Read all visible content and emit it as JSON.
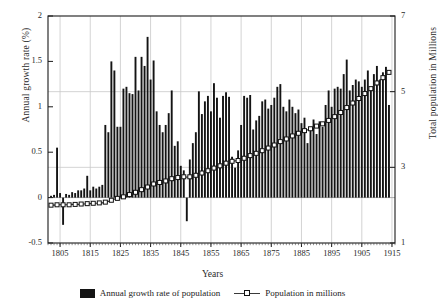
{
  "chart_data": {
    "type": "bar",
    "title": "",
    "xlabel": "Years",
    "ylabel": "Annual growth rate (%)",
    "ylabel_right": "Total population in Millions",
    "grid": true,
    "legend_position": "bottom-center",
    "xlim": [
      1801,
      1916
    ],
    "ylim": [
      -0.5,
      2
    ],
    "ylim_right": [
      1,
      7
    ],
    "xticks": [
      1805,
      1815,
      1825,
      1835,
      1845,
      1855,
      1865,
      1875,
      1885,
      1895,
      1905,
      1915
    ],
    "xtick_labels": [
      "1805",
      "1815",
      "1825",
      "1835",
      "1845",
      "1855",
      "1865",
      "1875",
      "1885",
      "1895",
      "1905",
      "1915"
    ],
    "yticks_left": [
      -0.5,
      0,
      0.5,
      1,
      1.5,
      2
    ],
    "ytick_labels_left": [
      "-0.5",
      "0",
      "0.5",
      "1",
      "1.5",
      "2"
    ],
    "yticks_right": [
      1,
      3,
      5,
      7
    ],
    "ytick_labels_right": [
      "1",
      "3",
      "5",
      "7"
    ],
    "series": [
      {
        "name": "Annual growth rate of population",
        "axis": "left",
        "type": "bar",
        "color": "#141414",
        "x": [
          1802,
          1803,
          1804,
          1805,
          1806,
          1807,
          1808,
          1809,
          1810,
          1811,
          1812,
          1813,
          1814,
          1815,
          1816,
          1817,
          1818,
          1819,
          1820,
          1821,
          1822,
          1823,
          1824,
          1825,
          1826,
          1827,
          1828,
          1829,
          1830,
          1831,
          1832,
          1833,
          1834,
          1835,
          1836,
          1837,
          1838,
          1839,
          1840,
          1841,
          1842,
          1843,
          1844,
          1845,
          1846,
          1847,
          1848,
          1849,
          1850,
          1851,
          1852,
          1853,
          1854,
          1855,
          1856,
          1857,
          1858,
          1859,
          1860,
          1861,
          1862,
          1863,
          1864,
          1865,
          1866,
          1867,
          1868,
          1869,
          1870,
          1871,
          1872,
          1873,
          1874,
          1875,
          1876,
          1877,
          1878,
          1879,
          1880,
          1881,
          1882,
          1883,
          1884,
          1885,
          1886,
          1887,
          1888,
          1889,
          1890,
          1891,
          1892,
          1893,
          1894,
          1895,
          1896,
          1897,
          1898,
          1899,
          1900,
          1901,
          1902,
          1903,
          1904,
          1905,
          1906,
          1907,
          1908,
          1909,
          1910,
          1911,
          1912,
          1913,
          1914
        ],
        "values": [
          0.02,
          0.03,
          0.55,
          0.05,
          -0.3,
          0.04,
          0.03,
          0.06,
          0.05,
          0.08,
          0.08,
          0.1,
          0.24,
          0.08,
          0.12,
          0.1,
          0.12,
          0.14,
          0.8,
          0.72,
          1.5,
          1.4,
          0.78,
          0.78,
          1.2,
          1.22,
          1.15,
          1.14,
          1.55,
          1.18,
          1.55,
          1.45,
          1.77,
          1.3,
          1.51,
          0.95,
          0.8,
          0.72,
          0.8,
          0.93,
          1.18,
          0.57,
          0.62,
          0.35,
          0.3,
          -0.26,
          0.42,
          0.6,
          0.72,
          1.17,
          0.92,
          1.06,
          1.12,
          0.95,
          1.26,
          1.1,
          0.88,
          1.12,
          1.16,
          1.11,
          0.45,
          0.33,
          0.52,
          0.8,
          1.12,
          1.1,
          1.13,
          0.75,
          0.85,
          0.9,
          1.06,
          1.08,
          0.98,
          1.02,
          1.1,
          1.22,
          1.25,
          1.0,
          0.95,
          1.08,
          1.0,
          0.93,
          0.97,
          0.82,
          0.88,
          0.6,
          0.75,
          0.86,
          0.7,
          0.84,
          0.78,
          1.02,
          1.18,
          1.0,
          1.2,
          1.22,
          1.2,
          1.36,
          1.52,
          1.18,
          1.24,
          1.3,
          1.28,
          1.22,
          1.3,
          1.4,
          1.18,
          1.36,
          1.45,
          1.3,
          1.38,
          1.44,
          1.02
        ]
      },
      {
        "name": "Population in millions",
        "axis": "right",
        "type": "line",
        "marker": "square",
        "color": "#2b2b2b",
        "x": [
          1802,
          1803,
          1804,
          1805,
          1806,
          1807,
          1808,
          1809,
          1810,
          1811,
          1812,
          1813,
          1814,
          1815,
          1816,
          1817,
          1818,
          1819,
          1820,
          1821,
          1822,
          1823,
          1824,
          1825,
          1826,
          1827,
          1828,
          1829,
          1830,
          1831,
          1832,
          1833,
          1834,
          1835,
          1836,
          1837,
          1838,
          1839,
          1840,
          1841,
          1842,
          1843,
          1844,
          1845,
          1846,
          1847,
          1848,
          1849,
          1850,
          1851,
          1852,
          1853,
          1854,
          1855,
          1856,
          1857,
          1858,
          1859,
          1860,
          1861,
          1862,
          1863,
          1864,
          1865,
          1866,
          1867,
          1868,
          1869,
          1870,
          1871,
          1872,
          1873,
          1874,
          1875,
          1876,
          1877,
          1878,
          1879,
          1880,
          1881,
          1882,
          1883,
          1884,
          1885,
          1886,
          1887,
          1888,
          1889,
          1890,
          1891,
          1892,
          1893,
          1894,
          1895,
          1896,
          1897,
          1898,
          1899,
          1900,
          1901,
          1902,
          1903,
          1904,
          1905,
          1906,
          1907,
          1908,
          1909,
          1910,
          1911,
          1912,
          1913,
          1914
        ],
        "values": [
          2.0,
          2.0,
          2.01,
          2.01,
          2.01,
          2.01,
          2.01,
          2.02,
          2.02,
          2.02,
          2.03,
          2.03,
          2.04,
          2.04,
          2.05,
          2.05,
          2.06,
          2.06,
          2.08,
          2.1,
          2.13,
          2.16,
          2.18,
          2.19,
          2.22,
          2.25,
          2.28,
          2.3,
          2.34,
          2.37,
          2.41,
          2.44,
          2.48,
          2.52,
          2.56,
          2.58,
          2.6,
          2.62,
          2.64,
          2.67,
          2.7,
          2.72,
          2.73,
          2.74,
          2.75,
          2.74,
          2.75,
          2.77,
          2.79,
          2.82,
          2.85,
          2.88,
          2.91,
          2.94,
          2.98,
          3.01,
          3.04,
          3.07,
          3.11,
          3.14,
          3.16,
          3.17,
          3.18,
          3.21,
          3.24,
          3.28,
          3.31,
          3.34,
          3.37,
          3.4,
          3.44,
          3.48,
          3.51,
          3.55,
          3.59,
          3.63,
          3.68,
          3.72,
          3.75,
          3.79,
          3.83,
          3.86,
          3.9,
          3.93,
          3.97,
          3.99,
          4.02,
          4.06,
          4.09,
          4.12,
          4.15,
          4.19,
          4.24,
          4.29,
          4.34,
          4.4,
          4.45,
          4.51,
          4.58,
          4.64,
          4.7,
          4.76,
          4.82,
          4.88,
          4.95,
          5.02,
          5.08,
          5.15,
          5.23,
          5.3,
          5.37,
          5.45,
          5.51
        ]
      }
    ]
  },
  "legend": {
    "items": [
      {
        "label": "Annual growth rate of population",
        "marker": "bar-swatch"
      },
      {
        "label": "Population in millions",
        "marker": "line-square"
      }
    ]
  },
  "colors": {
    "bar": "#141414",
    "line": "#2b2b2b",
    "grid": "#c8c8c8",
    "axis": "#1a1a1a",
    "background": "#ffffff"
  }
}
